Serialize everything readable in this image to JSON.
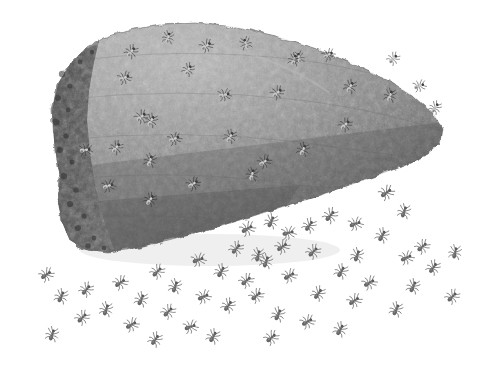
{
  "figure": {
    "title": "Ant mound with worker ants",
    "description": "Grayscale natural-history illustration of a wedge-shaped mound nest covered in ants, with a dispersing swarm of ants on the ground below and to the right.",
    "background_color": "#ffffff",
    "medium": "pencil-and-wash grayscale drawing",
    "orientation": "landscape"
  },
  "canvas": {
    "width": 490,
    "height": 369
  },
  "palette": {
    "background": "#ffffff",
    "mound_top_light": "#9a9a9a",
    "mound_mid": "#868686",
    "mound_lower_dark": "#606060",
    "mound_left_face_dark": "#4b4b4b",
    "mound_left_face_darkest": "#3a3a3a",
    "mound_outline": "#5c5c5c",
    "ant_body_ground": "#6f6f6f",
    "ant_body_dark": "#4f4f4f",
    "ant_on_mound_light": "#cfcfcf",
    "ant_on_mound_shadow": "#3d3d3d"
  },
  "mound": {
    "name": "ant-mound",
    "shape": "wedge / truncated cone tapering to the right",
    "outline_path": "M 60 178 L 54 140 L 52 110 L 58 84 L 70 64 L 86 48 L 104 38 L 128 30 L 160 25 L 196 23 L 236 27 L 276 36 L 320 50 L 358 66 L 392 82 L 416 98 L 434 114 L 442 128 L 440 142 L 428 154 L 406 164 L 376 176 L 336 190 L 292 204 L 248 218 L 206 230 L 170 240 L 136 248 L 108 252 L 86 250 L 70 240 L 62 222 L 58 200 Z",
    "left_face_path": "M 60 178 L 54 140 L 52 110 L 58 84 L 70 64 L 86 48 L 96 42 L 92 60 L 88 86 L 86 116 L 88 150 L 94 186 L 102 220 L 112 248 L 108 252 L 86 250 L 70 240 L 62 222 L 58 200 Z",
    "top_bumps": 22,
    "texture": "granular stippled clay / carton surface with cobbled nodules"
  },
  "ants_on_mound": {
    "name": "ants-on-mound",
    "count": 26,
    "render_style": "light highlighted bodies with dark outlines on gray surface",
    "items": [
      {
        "x": 131,
        "y": 52,
        "angle": 40,
        "scale": 1.0
      },
      {
        "x": 168,
        "y": 38,
        "angle": 15,
        "scale": 0.95
      },
      {
        "x": 206,
        "y": 46,
        "angle": 55,
        "scale": 1.0
      },
      {
        "x": 246,
        "y": 44,
        "angle": -20,
        "scale": 0.95
      },
      {
        "x": 124,
        "y": 78,
        "angle": 65,
        "scale": 1.0
      },
      {
        "x": 151,
        "y": 121,
        "angle": 30,
        "scale": 1.0
      },
      {
        "x": 188,
        "y": 70,
        "angle": 35,
        "scale": 0.95
      },
      {
        "x": 224,
        "y": 95,
        "angle": 75,
        "scale": 1.0
      },
      {
        "x": 277,
        "y": 93,
        "angle": 50,
        "scale": 1.0
      },
      {
        "x": 294,
        "y": 60,
        "angle": 20,
        "scale": 0.95
      },
      {
        "x": 299,
        "y": 58,
        "angle": -10,
        "scale": 0.9
      },
      {
        "x": 328,
        "y": 55,
        "angle": 60,
        "scale": 0.95
      },
      {
        "x": 350,
        "y": 87,
        "angle": 30,
        "scale": 1.0
      },
      {
        "x": 393,
        "y": 59,
        "angle": 45,
        "scale": 0.95
      },
      {
        "x": 390,
        "y": 96,
        "angle": 20,
        "scale": 1.0
      },
      {
        "x": 419,
        "y": 86,
        "angle": 70,
        "scale": 0.95
      },
      {
        "x": 435,
        "y": 108,
        "angle": 35,
        "scale": 0.95
      },
      {
        "x": 141,
        "y": 117,
        "angle": 50,
        "scale": 1.0
      },
      {
        "x": 85,
        "y": 150,
        "angle": 80,
        "scale": 1.0
      },
      {
        "x": 116,
        "y": 148,
        "angle": 40,
        "scale": 1.0
      },
      {
        "x": 150,
        "y": 161,
        "angle": 20,
        "scale": 1.0
      },
      {
        "x": 174,
        "y": 139,
        "angle": 65,
        "scale": 1.0
      },
      {
        "x": 230,
        "y": 137,
        "angle": 30,
        "scale": 1.0
      },
      {
        "x": 264,
        "y": 162,
        "angle": 55,
        "scale": 1.0
      },
      {
        "x": 303,
        "y": 150,
        "angle": 25,
        "scale": 1.0
      },
      {
        "x": 345,
        "y": 125,
        "angle": 45,
        "scale": 1.0
      },
      {
        "x": 108,
        "y": 186,
        "angle": 70,
        "scale": 1.0
      },
      {
        "x": 150,
        "y": 200,
        "angle": 35,
        "scale": 1.0
      },
      {
        "x": 193,
        "y": 184,
        "angle": 55,
        "scale": 1.0
      },
      {
        "x": 252,
        "y": 175,
        "angle": 15,
        "scale": 1.0
      }
    ]
  },
  "ants_on_ground": {
    "name": "ants-on-ground",
    "count": 52,
    "render_style": "dark gray bodies with six legs and antennae on white background",
    "items": [
      {
        "x": 386,
        "y": 193,
        "angle": 55,
        "scale": 1.05
      },
      {
        "x": 404,
        "y": 212,
        "angle": 20,
        "scale": 1.0
      },
      {
        "x": 330,
        "y": 216,
        "angle": 40,
        "scale": 1.05
      },
      {
        "x": 355,
        "y": 224,
        "angle": 70,
        "scale": 1.0
      },
      {
        "x": 382,
        "y": 236,
        "angle": 30,
        "scale": 1.0
      },
      {
        "x": 422,
        "y": 247,
        "angle": 50,
        "scale": 1.0
      },
      {
        "x": 455,
        "y": 253,
        "angle": 15,
        "scale": 1.0
      },
      {
        "x": 247,
        "y": 229,
        "angle": 60,
        "scale": 1.05
      },
      {
        "x": 271,
        "y": 222,
        "angle": 25,
        "scale": 1.0
      },
      {
        "x": 288,
        "y": 233,
        "angle": 75,
        "scale": 1.0
      },
      {
        "x": 309,
        "y": 226,
        "angle": 35,
        "scale": 1.0
      },
      {
        "x": 313,
        "y": 252,
        "angle": 45,
        "scale": 1.0
      },
      {
        "x": 357,
        "y": 256,
        "angle": 20,
        "scale": 1.0
      },
      {
        "x": 406,
        "y": 258,
        "angle": 65,
        "scale": 1.0
      },
      {
        "x": 236,
        "y": 249,
        "angle": 40,
        "scale": 1.0
      },
      {
        "x": 258,
        "y": 256,
        "angle": 15,
        "scale": 1.0
      },
      {
        "x": 282,
        "y": 247,
        "angle": 55,
        "scale": 1.0
      },
      {
        "x": 341,
        "y": 272,
        "angle": 30,
        "scale": 1.0
      },
      {
        "x": 369,
        "y": 283,
        "angle": 60,
        "scale": 1.0
      },
      {
        "x": 413,
        "y": 287,
        "angle": 25,
        "scale": 1.0
      },
      {
        "x": 452,
        "y": 297,
        "angle": 45,
        "scale": 1.0
      },
      {
        "x": 198,
        "y": 260,
        "angle": 70,
        "scale": 1.0
      },
      {
        "x": 221,
        "y": 272,
        "angle": 30,
        "scale": 1.0
      },
      {
        "x": 246,
        "y": 281,
        "angle": 50,
        "scale": 1.0
      },
      {
        "x": 266,
        "y": 262,
        "angle": 20,
        "scale": 1.0
      },
      {
        "x": 289,
        "y": 276,
        "angle": 60,
        "scale": 1.0
      },
      {
        "x": 318,
        "y": 294,
        "angle": 35,
        "scale": 1.0
      },
      {
        "x": 354,
        "y": 301,
        "angle": 55,
        "scale": 1.0
      },
      {
        "x": 396,
        "y": 310,
        "angle": 25,
        "scale": 1.0
      },
      {
        "x": 157,
        "y": 272,
        "angle": 45,
        "scale": 1.0
      },
      {
        "x": 175,
        "y": 287,
        "angle": 20,
        "scale": 1.0
      },
      {
        "x": 203,
        "y": 297,
        "angle": 65,
        "scale": 1.0
      },
      {
        "x": 228,
        "y": 306,
        "angle": 35,
        "scale": 1.0
      },
      {
        "x": 256,
        "y": 296,
        "angle": 50,
        "scale": 1.0
      },
      {
        "x": 278,
        "y": 315,
        "angle": 25,
        "scale": 1.0
      },
      {
        "x": 307,
        "y": 322,
        "angle": 60,
        "scale": 1.0
      },
      {
        "x": 340,
        "y": 330,
        "angle": 30,
        "scale": 1.0
      },
      {
        "x": 120,
        "y": 283,
        "angle": 55,
        "scale": 1.0
      },
      {
        "x": 141,
        "y": 300,
        "angle": 25,
        "scale": 1.0
      },
      {
        "x": 168,
        "y": 312,
        "angle": 45,
        "scale": 1.0
      },
      {
        "x": 190,
        "y": 327,
        "angle": 70,
        "scale": 1.0
      },
      {
        "x": 213,
        "y": 337,
        "angle": 30,
        "scale": 1.0
      },
      {
        "x": 86,
        "y": 290,
        "angle": 40,
        "scale": 1.0
      },
      {
        "x": 106,
        "y": 310,
        "angle": 20,
        "scale": 1.0
      },
      {
        "x": 131,
        "y": 325,
        "angle": 60,
        "scale": 1.0
      },
      {
        "x": 155,
        "y": 340,
        "angle": 35,
        "scale": 1.0
      },
      {
        "x": 46,
        "y": 275,
        "angle": 55,
        "scale": 1.0
      },
      {
        "x": 61,
        "y": 297,
        "angle": 25,
        "scale": 1.0
      },
      {
        "x": 82,
        "y": 318,
        "angle": 45,
        "scale": 1.0
      },
      {
        "x": 52,
        "y": 335,
        "angle": 20,
        "scale": 1.0
      },
      {
        "x": 271,
        "y": 338,
        "angle": 50,
        "scale": 1.0
      },
      {
        "x": 433,
        "y": 268,
        "angle": 35,
        "scale": 1.0
      }
    ]
  },
  "ant_anatomy": {
    "parts": [
      "head",
      "thorax",
      "gaster",
      "antennae",
      "legs"
    ],
    "leg_count": 6,
    "antenna_count": 2,
    "body_length_px": 11
  }
}
